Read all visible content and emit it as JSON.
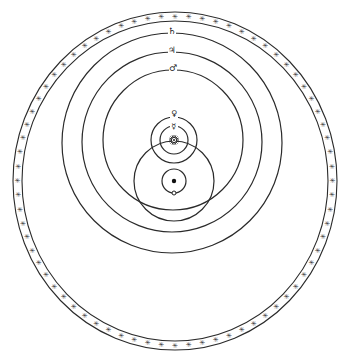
{
  "diagram": {
    "type": "geo-heliocentric planetary system",
    "background": "#ffffff",
    "ink": "#2a2a2a",
    "fixed_stars_ring": {
      "cx": 175,
      "cy": 181,
      "rx_outer": 162,
      "ry_outer": 169,
      "rx_inner": 153,
      "ry_inner": 160,
      "star_glyph": "✳",
      "star_count": 72
    },
    "earth": {
      "cx": 174,
      "cy": 181,
      "r": 2.2,
      "label": "Earth"
    },
    "moon_orbit": {
      "cx": 174,
      "cy": 181,
      "r": 12,
      "moon": {
        "x": 174,
        "y": 193,
        "r": 2
      }
    },
    "sun_orbit": {
      "cx": 174,
      "cy": 181,
      "r": 40
    },
    "sun": {
      "x": 174,
      "y": 140,
      "glyph": "☼",
      "label": "Sun"
    },
    "heliocentric_orbits": [
      {
        "name": "Mercury",
        "symbol": "☿",
        "cx": 174,
        "cy": 140,
        "r": 14,
        "label_y": 126
      },
      {
        "name": "Venus",
        "symbol": "♀",
        "cx": 174,
        "cy": 140,
        "r": 23,
        "label_y": 113
      },
      {
        "name": "Mars",
        "symbol": "♂",
        "cx": 173,
        "cy": 140,
        "r": 70,
        "label_y": 68
      },
      {
        "name": "Jupiter",
        "symbol": "♃",
        "cx": 172,
        "cy": 142,
        "r": 90,
        "label_y": 50
      },
      {
        "name": "Saturn",
        "symbol": "♄",
        "cx": 172,
        "cy": 143,
        "r": 110,
        "label_y": 31
      }
    ]
  }
}
